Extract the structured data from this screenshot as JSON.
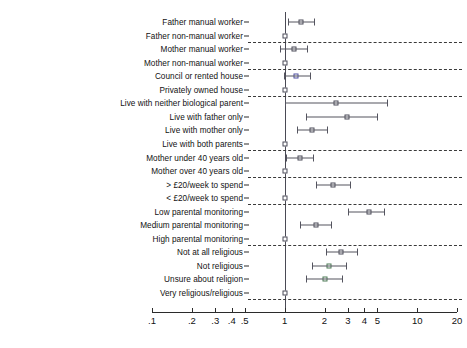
{
  "chart_data": {
    "type": "scatter",
    "title": "",
    "xlabel": "",
    "ylabel": "",
    "scale": "log",
    "xlim": [
      0.1,
      20
    ],
    "grid": false,
    "legend_position": "none",
    "reference_value": 1,
    "xticks": [
      {
        "value": 0.1,
        "label": ".1"
      },
      {
        "value": 0.2,
        "label": ".2"
      },
      {
        "value": 0.3,
        "label": ".3"
      },
      {
        "value": 0.4,
        "label": ".4"
      },
      {
        "value": 0.5,
        "label": ".5"
      },
      {
        "value": 1,
        "label": "1"
      },
      {
        "value": 2,
        "label": "2"
      },
      {
        "value": 3,
        "label": "3"
      },
      {
        "value": 4,
        "label": "4"
      },
      {
        "value": 5,
        "label": "5"
      },
      {
        "value": 10,
        "label": "10"
      },
      {
        "value": 20,
        "label": "20"
      }
    ],
    "categories": [
      "Father manual worker",
      "Father non-manual worker",
      "Mother manual worker",
      "Mother non-manual worker",
      "Council or rented house",
      "Privately owned house",
      "Live with neither biological parent",
      "Live with father only",
      "Live with mother only",
      "Live with both parents",
      "Mother under 40 years old",
      "Mother over 40 years old",
      "> £20/week to spend",
      "< £20/week to spend",
      "Low parental monitoring",
      "Medium parental monitoring",
      "High parental monitoring",
      "Not at all religious",
      "Not religious",
      "Unsure about religion",
      "Very religious/religious"
    ],
    "points": [
      {
        "label": "Father manual worker",
        "estimate": 1.33,
        "low": 1.06,
        "high": 1.67,
        "reference": false,
        "color": "grey"
      },
      {
        "label": "Father non-manual worker",
        "estimate": 1.0,
        "low": 1.0,
        "high": 1.0,
        "reference": true,
        "color": "grey"
      },
      {
        "label": "Mother manual worker",
        "estimate": 1.17,
        "low": 0.92,
        "high": 1.48,
        "reference": false,
        "color": "grey"
      },
      {
        "label": "Mother non-manual worker",
        "estimate": 1.0,
        "low": 1.0,
        "high": 1.0,
        "reference": true,
        "color": "grey"
      },
      {
        "label": "Council or rented house",
        "estimate": 1.21,
        "low": 0.99,
        "high": 1.55,
        "reference": false,
        "color": "blue"
      },
      {
        "label": "Privately owned house",
        "estimate": 1.0,
        "low": 1.0,
        "high": 1.0,
        "reference": true,
        "color": "grey"
      },
      {
        "label": "Live with neither biological parent",
        "estimate": 2.45,
        "low": 1.0,
        "high": 5.9,
        "reference": false,
        "color": "grey"
      },
      {
        "label": "Live with father only",
        "estimate": 2.95,
        "low": 1.45,
        "high": 5.0,
        "reference": false,
        "color": "grey"
      },
      {
        "label": "Live with mother only",
        "estimate": 1.62,
        "low": 1.24,
        "high": 2.1,
        "reference": false,
        "color": "grey"
      },
      {
        "label": "Live with both parents",
        "estimate": 1.0,
        "low": 1.0,
        "high": 1.0,
        "reference": true,
        "color": "grey"
      },
      {
        "label": "Mother under 40 years old",
        "estimate": 1.31,
        "low": 1.03,
        "high": 1.65,
        "reference": false,
        "color": "grey"
      },
      {
        "label": "Mother over 40 years old",
        "estimate": 1.0,
        "low": 1.0,
        "high": 1.0,
        "reference": true,
        "color": "grey"
      },
      {
        "label": "> £20/week to spend",
        "estimate": 2.32,
        "low": 1.74,
        "high": 3.1,
        "reference": false,
        "color": "grey"
      },
      {
        "label": "< £20/week to spend",
        "estimate": 1.0,
        "low": 1.0,
        "high": 1.0,
        "reference": true,
        "color": "grey"
      },
      {
        "label": "Low parental monitoring",
        "estimate": 4.3,
        "low": 3.0,
        "high": 5.6,
        "reference": false,
        "color": "grey"
      },
      {
        "label": "Medium parental monitoring",
        "estimate": 1.72,
        "low": 1.3,
        "high": 2.25,
        "reference": false,
        "color": "grey"
      },
      {
        "label": "High parental monitoring",
        "estimate": 1.0,
        "low": 1.0,
        "high": 1.0,
        "reference": true,
        "color": "grey"
      },
      {
        "label": "Not at all religious",
        "estimate": 2.68,
        "low": 2.05,
        "high": 3.5,
        "reference": false,
        "color": "grey"
      },
      {
        "label": "Not religious",
        "estimate": 2.15,
        "low": 1.61,
        "high": 2.88,
        "reference": false,
        "color": "green"
      },
      {
        "label": "Unsure about religion",
        "estimate": 2.0,
        "low": 1.45,
        "high": 2.72,
        "reference": false,
        "color": "green"
      },
      {
        "label": "Very religious/religious",
        "estimate": 1.0,
        "low": 1.0,
        "high": 1.0,
        "reference": true,
        "color": "grey"
      }
    ],
    "group_separators_after": [
      "Father non-manual worker",
      "Mother non-manual worker",
      "Privately owned house",
      "Live with both parents",
      "Mother over 40 years old",
      "< £20/week to spend",
      "High parental monitoring",
      "Very religious/religious"
    ]
  },
  "colors": {
    "marker_grey": "#4b4b58",
    "marker_green": "#4d7a56",
    "marker_blue": "#4f4fa0",
    "axis": "#2b2b2b",
    "reference_line": "#4a4a55",
    "separator": "#3a3a3a",
    "background": "#ffffff"
  }
}
